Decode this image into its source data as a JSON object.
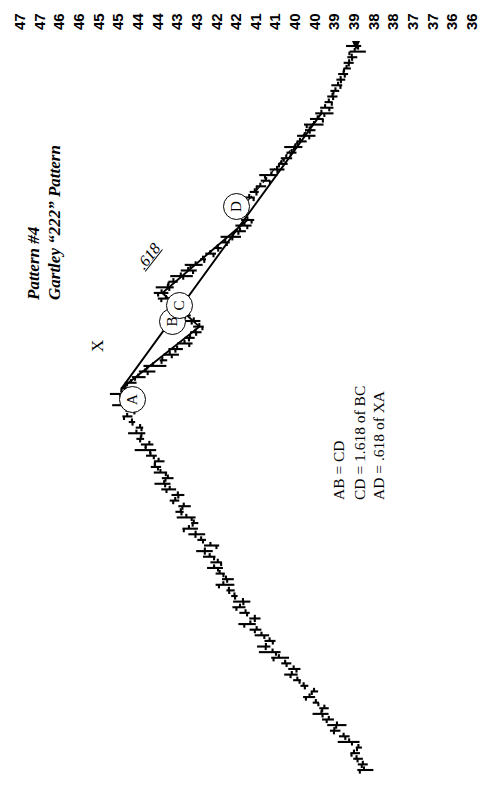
{
  "chart_data": {
    "type": "bar",
    "title": "Pattern #4",
    "subtitle": "Gartley “222” Pattern",
    "orientation": "rotated-90-ccw",
    "xlabel": "",
    "ylabel": "Price",
    "grid": false,
    "legend": "none",
    "axis_tick_labels": [
      "47",
      "47",
      "46",
      "46",
      "45",
      "45",
      "44",
      "44",
      "43",
      "43",
      "42",
      "42",
      "41",
      "41",
      "40",
      "40",
      "39",
      "39",
      "38",
      "38",
      "37",
      "37",
      "36",
      "36"
    ],
    "ylim": [
      35.5,
      47.5
    ],
    "pivot_points": [
      {
        "label": "X",
        "price": 39.3,
        "type": "swing-low"
      },
      {
        "label": "A",
        "price": 44.7,
        "type": "swing-high"
      },
      {
        "label": "B",
        "price": 42.6,
        "type": "swing-low"
      },
      {
        "label": "C",
        "price": 43.6,
        "type": "swing-high"
      },
      {
        "label": "D",
        "price": 41.3,
        "type": "swing-low"
      }
    ],
    "annotations": [
      {
        "text": ".618",
        "on": "XA retracement dashed line"
      },
      {
        "text": "AB = CD"
      },
      {
        "text": "CD = 1.618 of BC"
      },
      {
        "text": "AD = .618 of XA"
      }
    ],
    "series": [
      {
        "name": "price-bars",
        "type": "ohlc",
        "values": [
          38.15,
          38.18,
          38.35,
          38.42,
          38.3,
          38.55,
          38.7,
          38.95,
          38.88,
          39.1,
          39.3,
          39.22,
          39.45,
          39.62,
          39.5,
          39.78,
          39.95,
          40.1,
          40.05,
          40.28,
          40.45,
          40.62,
          40.8,
          40.7,
          40.92,
          41.05,
          41.22,
          41.1,
          41.35,
          41.5,
          41.42,
          41.65,
          41.8,
          41.95,
          41.88,
          42.05,
          42.2,
          42.1,
          42.32,
          42.45,
          42.3,
          42.55,
          42.7,
          42.88,
          42.75,
          42.95,
          43.1,
          43.02,
          43.25,
          43.18,
          43.4,
          43.55,
          43.45,
          43.65,
          43.8,
          43.7,
          43.92,
          44.05,
          43.95,
          44.18,
          44.3,
          44.2,
          44.42,
          44.55,
          44.45,
          44.65,
          44.55,
          44.7,
          44.6,
          44.45,
          44.25,
          44.05,
          43.85,
          43.6,
          43.4,
          43.2,
          43.0,
          42.85,
          42.7,
          42.6,
          42.75,
          42.95,
          43.15,
          43.35,
          43.5,
          43.62,
          43.45,
          43.3,
          43.1,
          42.9,
          42.7,
          42.5,
          42.3,
          42.1,
          41.9,
          41.7,
          41.5,
          41.38,
          41.3,
          41.45,
          41.6,
          41.42,
          41.25,
          41.1,
          40.95,
          40.8,
          40.65,
          40.5,
          40.38,
          40.25,
          40.1,
          40.0,
          39.88,
          39.75,
          39.62,
          39.5,
          39.4,
          39.3,
          39.2,
          39.1,
          39.0,
          38.92,
          38.85,
          38.78,
          38.7,
          38.62,
          38.55,
          38.48,
          38.4,
          38.35
        ]
      }
    ]
  },
  "scale": {
    "name": "price-scale",
    "labels": [
      "47",
      "47",
      "46",
      "46",
      "45",
      "45",
      "44",
      "44",
      "43",
      "43",
      "42",
      "42",
      "41",
      "41",
      "40",
      "40",
      "39",
      "39",
      "38",
      "38",
      "37",
      "37",
      "36",
      "36"
    ]
  },
  "titles": {
    "main": "Pattern #4",
    "sub": "Gartley “222” Pattern"
  },
  "formulas": {
    "line0": "AB = CD",
    "line1": "CD = 1.618 of BC",
    "line2": "AD = .618 of XA"
  },
  "markers": {
    "x": "X",
    "a": "A",
    "b": "B",
    "c": "C",
    "d": "D",
    "ratio": ".618"
  },
  "colors": {
    "ink": "#000000",
    "paper": "#ffffff"
  }
}
